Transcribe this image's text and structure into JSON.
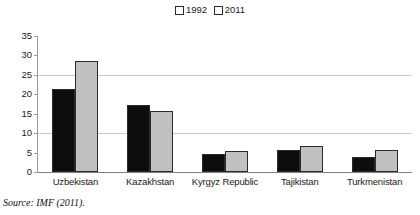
{
  "chart_data": {
    "type": "bar",
    "title": "",
    "subtitle": "",
    "xlabel": "",
    "ylabel": "",
    "categories": [
      "Uzbekistan",
      "Kazakhstan",
      "Kyrgyz Republic",
      "Tajikistan",
      "Turkmenistan"
    ],
    "series": [
      {
        "name": "1992",
        "color": "#0d0d0d",
        "values": [
          21.3,
          17.2,
          4.6,
          5.6,
          3.9
        ]
      },
      {
        "name": "2011",
        "color": "#c0c0c0",
        "values": [
          28.5,
          15.7,
          5.5,
          6.8,
          5.6
        ]
      }
    ],
    "ylim": [
      0,
      35
    ],
    "ytick_values": [
      0,
      5,
      10,
      15,
      20,
      25,
      30,
      35
    ],
    "ytick_labels": [
      "0",
      "5",
      "10",
      "15",
      "20",
      "25",
      "30",
      "35"
    ],
    "gridlines_at": [
      10,
      25
    ],
    "grid": true,
    "legend_position": "top-center",
    "annotations": [
      "Source: IMF (2011)."
    ]
  },
  "legend": {
    "entries": [
      {
        "label": "1992",
        "swatch": "legend-swatch-1992"
      },
      {
        "label": "2011",
        "swatch": "legend-swatch-2011"
      }
    ]
  },
  "source": {
    "text": "Source: IMF (2011)."
  }
}
